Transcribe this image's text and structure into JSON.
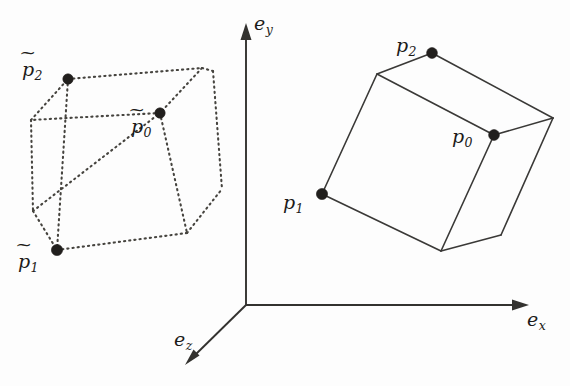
{
  "figure": {
    "background_color": "#fdfdfd",
    "ink_color": "#33322f",
    "width": 570,
    "height": 386
  },
  "axes": {
    "origin": {
      "x": 246,
      "y": 305
    },
    "items": [
      {
        "id": "ey",
        "name": "e_y",
        "base": "e",
        "sub": "y",
        "label_x": 254,
        "label_y": 14,
        "tip": {
          "x": 246,
          "y": 24
        },
        "tail": {
          "x": 246,
          "y": 305
        },
        "direction": "up"
      },
      {
        "id": "ex",
        "name": "e_x",
        "base": "e",
        "sub": "x",
        "label_x": 527,
        "label_y": 310,
        "tip": {
          "x": 528,
          "y": 305
        },
        "tail": {
          "x": 246,
          "y": 305
        },
        "direction": "right"
      },
      {
        "id": "ez",
        "name": "e_z",
        "base": "e",
        "sub": "z",
        "label_x": 174,
        "label_y": 330,
        "tip": {
          "x": 186,
          "y": 364
        },
        "tail": {
          "x": 246,
          "y": 305
        },
        "direction": "down-left"
      }
    ]
  },
  "shapes": [
    {
      "id": "source-cube",
      "name": "original-cube",
      "style": "dashed",
      "vertices": {
        "v_top_back_left": {
          "x": 31,
          "y": 120
        },
        "v_top_front_left": {
          "x": 68,
          "y": 79
        },
        "v_top_front_right": {
          "x": 202,
          "y": 68
        },
        "v_top_back_right": {
          "x": 160,
          "y": 113
        },
        "v_bot_back_left": {
          "x": 33,
          "y": 211
        },
        "v_bot_front_left": {
          "x": 57,
          "y": 250
        },
        "v_bot_front_right": {
          "x": 187,
          "y": 233
        },
        "v_bot_back_right": {
          "x": 213,
          "y": 189
        },
        "v_far_right_top": {
          "x": 213,
          "y": 71
        }
      },
      "points": [
        {
          "id": "p2t",
          "base": "p",
          "sub": "2",
          "tilde": true,
          "x": 68,
          "y": 79,
          "label_x": 22,
          "label_y": 60
        },
        {
          "id": "p0t",
          "base": "p",
          "sub": "0",
          "tilde": true,
          "x": 160,
          "y": 113,
          "label_x": 131,
          "label_y": 117
        },
        {
          "id": "p1t",
          "base": "p",
          "sub": "1",
          "tilde": true,
          "x": 57,
          "y": 250,
          "label_x": 18,
          "label_y": 252
        }
      ]
    },
    {
      "id": "target-cube",
      "name": "transformed-cube",
      "style": "solid",
      "vertices": {
        "v_top_back_left": {
          "x": 377,
          "y": 74
        },
        "v_top_front_left": {
          "x": 432,
          "y": 53
        },
        "v_top_front_right": {
          "x": 553,
          "y": 118
        },
        "v_top_back_right": {
          "x": 494,
          "y": 135
        },
        "v_bot_front_left": {
          "x": 322,
          "y": 194
        },
        "v_bot_front_right": {
          "x": 441,
          "y": 251
        },
        "v_bot_back_right": {
          "x": 501,
          "y": 235
        }
      },
      "points": [
        {
          "id": "p2",
          "base": "p",
          "sub": "2",
          "tilde": false,
          "x": 432,
          "y": 53,
          "label_x": 396,
          "label_y": 36
        },
        {
          "id": "p0",
          "base": "p",
          "sub": "0",
          "tilde": false,
          "x": 494,
          "y": 135,
          "label_x": 452,
          "label_y": 127
        },
        {
          "id": "p1",
          "base": "p",
          "sub": "1",
          "tilde": false,
          "x": 322,
          "y": 194,
          "label_x": 283,
          "label_y": 193
        }
      ]
    }
  ]
}
